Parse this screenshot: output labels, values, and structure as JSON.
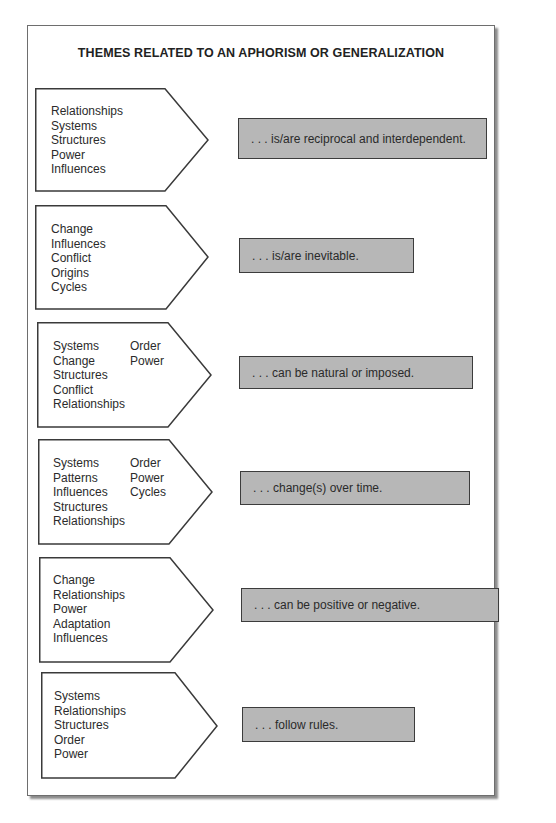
{
  "title": "THEMES RELATED TO AN APHORISM OR GENERALIZATION",
  "colors": {
    "box_fill": "#b7b7b7",
    "box_border": "#3c3c3c",
    "outline": "#3a3a3a",
    "background": "#ffffff"
  },
  "rows": [
    {
      "themes": {
        "col1": [
          "Relationships",
          "Systems",
          "Structures",
          "Power",
          "Influences"
        ],
        "col2": []
      },
      "generalization": ". . . is/are reciprocal and interdependent."
    },
    {
      "themes": {
        "col1": [
          "Change",
          "Influences",
          "Conflict",
          "Origins",
          "Cycles"
        ],
        "col2": []
      },
      "generalization": ". . . is/are inevitable."
    },
    {
      "themes": {
        "col1": [
          "Systems",
          "Change",
          "Structures",
          "Conflict",
          "Relationships"
        ],
        "col2": [
          "Order",
          "Power"
        ]
      },
      "generalization": ". . . can be natural or imposed."
    },
    {
      "themes": {
        "col1": [
          "Systems",
          "Patterns",
          "Influences",
          "Structures",
          "Relationships"
        ],
        "col2": [
          "Order",
          "Power",
          "Cycles"
        ]
      },
      "generalization": ". . . change(s) over time."
    },
    {
      "themes": {
        "col1": [
          "Change",
          "Relationships",
          "Power",
          "Adaptation",
          "Influences"
        ],
        "col2": []
      },
      "generalization": ". . . can be positive or negative."
    },
    {
      "themes": {
        "col1": [
          "Systems",
          "Relationships",
          "Structures",
          "Order",
          "Power"
        ],
        "col2": []
      },
      "generalization": ". . . follow rules."
    }
  ]
}
